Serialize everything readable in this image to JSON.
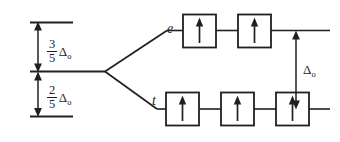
{
  "diagram": {
    "type": "energy-level-diagram",
    "colors": {
      "ink": "#231f20",
      "background": "#ffffff"
    },
    "barycenter": {
      "name": "barycenter-level",
      "label": ""
    },
    "upper_gap": {
      "numerator": "3",
      "denominator": "5",
      "delta_symbol": "Δ",
      "delta_subscript": "o",
      "full_text": "3/5 Δo"
    },
    "lower_gap": {
      "numerator": "2",
      "denominator": "5",
      "delta_symbol": "Δ",
      "delta_subscript": "o",
      "full_text": "2/5 Δo"
    },
    "total_split": {
      "delta_symbol": "Δ",
      "delta_subscript": "o",
      "full_text": "Δo"
    },
    "levels": [
      {
        "id": "e",
        "label": "e",
        "position": "upper",
        "orbital_count": 2,
        "electrons": [
          "up",
          "up"
        ]
      },
      {
        "id": "t",
        "label": "t",
        "position": "lower",
        "orbital_count": 3,
        "electrons": [
          "up",
          "up",
          "up"
        ]
      }
    ],
    "spin_glyph": "↑"
  }
}
